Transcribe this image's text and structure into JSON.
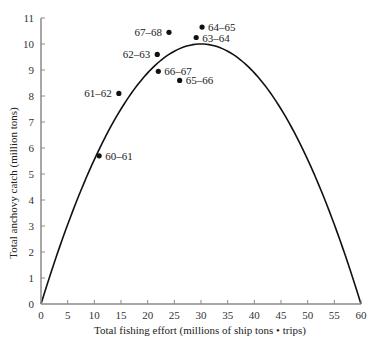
{
  "chart_data": {
    "type": "scatter",
    "title": "",
    "xlabel": "Total fishing effort (millions of ship tons • trips)",
    "ylabel": "Total anchovy catch (million tons)",
    "xlim": [
      0,
      60
    ],
    "ylim": [
      0,
      11
    ],
    "xticks": [
      0,
      5,
      10,
      15,
      20,
      25,
      30,
      35,
      40,
      45,
      50,
      55,
      60
    ],
    "yticks": [
      0,
      1,
      2,
      3,
      4,
      5,
      6,
      7,
      8,
      9,
      10,
      11
    ],
    "grid": false,
    "legend": null,
    "series": [
      {
        "name": "Observed catch by season",
        "type": "scatter",
        "points": [
          {
            "label": "60–61",
            "x": 10.9,
            "y": 5.7
          },
          {
            "label": "61–62",
            "x": 14.6,
            "y": 8.1
          },
          {
            "label": "62–63",
            "x": 21.8,
            "y": 9.6
          },
          {
            "label": "63–64",
            "x": 29.1,
            "y": 10.25
          },
          {
            "label": "64–65",
            "x": 30.2,
            "y": 10.65
          },
          {
            "label": "65–66",
            "x": 26.0,
            "y": 8.6
          },
          {
            "label": "66–67",
            "x": 22.0,
            "y": 8.95
          },
          {
            "label": "67–68",
            "x": 24.0,
            "y": 10.45
          }
        ]
      },
      {
        "name": "Sustainable yield curve",
        "type": "line",
        "shape": "parabola",
        "x": [
          0,
          5,
          10,
          15,
          20,
          25,
          30,
          35,
          40,
          45,
          50,
          55,
          60
        ],
        "y": [
          0,
          3.06,
          5.56,
          7.5,
          8.89,
          9.72,
          10.0,
          9.72,
          8.89,
          7.5,
          5.56,
          3.06,
          0
        ]
      }
    ]
  }
}
